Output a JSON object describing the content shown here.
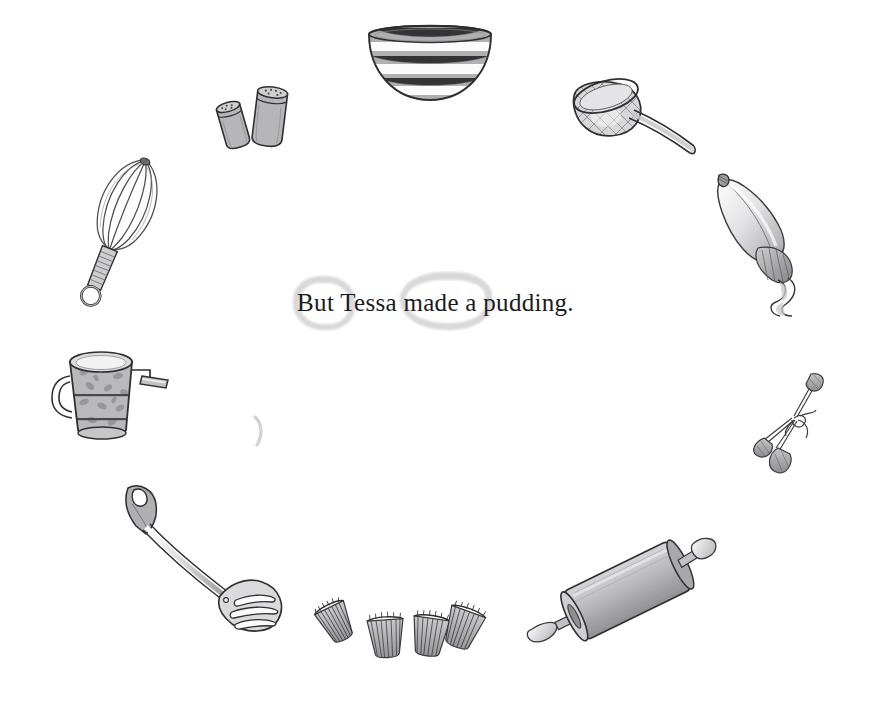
{
  "page": {
    "title": "But Tessa made a pudding.",
    "width": 871,
    "height": 722,
    "background_color": "#ffffff",
    "text_color": "#1b1b1b",
    "ink_color": "#3a3a3a",
    "wash_color": "#a9a9ad",
    "stain_color": "#b9b9bc"
  },
  "caption": {
    "text": "But Tessa made a pudding.",
    "font_style": "serif",
    "align": "center"
  },
  "illustration": {
    "description": "Hand-drawn baking utensils arranged in an oval ring around a centered line of text",
    "style": "pen-and-ink with grey watercolour wash",
    "items": [
      {
        "name": "mixing-bowl",
        "label": "Mixing bowl",
        "position": "top-center"
      },
      {
        "name": "salt-pepper-shakers",
        "label": "Salt and pepper shakers",
        "position": "top-left"
      },
      {
        "name": "sieve",
        "label": "Mesh sieve",
        "position": "top-right"
      },
      {
        "name": "whisk",
        "label": "Balloon whisk",
        "position": "left-upper"
      },
      {
        "name": "piping-bag",
        "label": "Piping bag with icing",
        "position": "right-upper"
      },
      {
        "name": "flour-sifter",
        "label": "Flour sifter with crank",
        "position": "left-lower"
      },
      {
        "name": "piping-nozzles",
        "label": "Bundled piping nozzles",
        "position": "right-lower"
      },
      {
        "name": "slotted-turner",
        "label": "Slotted turner",
        "position": "bottom-left"
      },
      {
        "name": "cupcake-cases",
        "label": "Four cupcake cases",
        "position": "bottom-center"
      },
      {
        "name": "rolling-pin",
        "label": "Rolling pin",
        "position": "bottom-right"
      }
    ],
    "stains": [
      {
        "name": "ring-stain-left",
        "position": "behind caption, left"
      },
      {
        "name": "ring-stain-right",
        "position": "behind caption, right"
      },
      {
        "name": "ring-stain-partial",
        "position": "below caption, left of centre"
      }
    ]
  }
}
